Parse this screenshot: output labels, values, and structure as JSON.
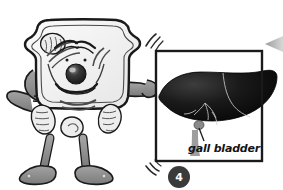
{
  "figure": {
    "background_color": "#ffffff"
  },
  "character": {
    "name": "cell-character",
    "body_fill": "#f2f2f2",
    "outline_color": "#1a1a1a",
    "limb_fill": "#8d8d8d",
    "nose_color": "#2b2b2b",
    "organelles": [
      "mitochondrion-top-left",
      "mitochondrion-bottom-left",
      "mitochondrion-bottom-right",
      "nucleolus-center",
      "endoplasmic-reticulum-lines"
    ]
  },
  "photo_frame": {
    "name": "liver-photo-frame",
    "border_color": "#1a1a1a",
    "fill_color": "#ffffff",
    "content": "liver",
    "liver_color": "#0d0d0d",
    "motion_lines": [
      "top-left-shake",
      "bottom-left-shake"
    ]
  },
  "annotation": {
    "gall_bladder_label": "gall bladder",
    "leader_line_color": "#1a1a1a"
  },
  "step_marker": {
    "number": "4",
    "background_color": "#3a3a3a",
    "text_color": "#ffffff"
  },
  "pointer": {
    "name": "right-edge-arrow",
    "direction": "left",
    "color": "#b8b8b8"
  }
}
